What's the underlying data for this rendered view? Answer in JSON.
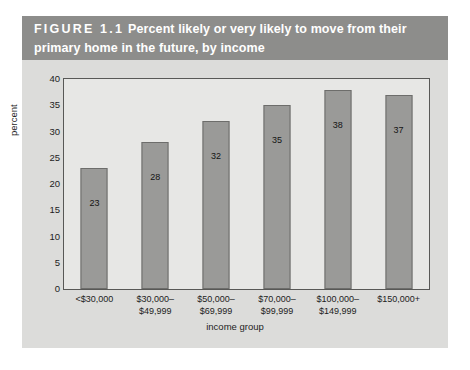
{
  "figure": {
    "number_label": "FIGURE 1.1",
    "title_line1": "Percent likely or very likely to move from their",
    "title_line2": "primary home in the future, by income",
    "header_bg": "#8d8d8b",
    "panel_bg": "#dcdcda",
    "plot_bg": "#e7e7e5",
    "bar_color": "#9a9a98",
    "bar_border_color": "#6d6d6b",
    "axis_color": "#585856"
  },
  "chart_data": {
    "type": "bar",
    "xlabel": "income group",
    "ylabel": "percent",
    "ylim": [
      0,
      40
    ],
    "yticks": [
      0,
      5,
      10,
      15,
      20,
      25,
      30,
      35,
      40
    ],
    "ytick_labels": [
      "0",
      "5",
      "10",
      "15",
      "20",
      "25",
      "30",
      "35",
      "40"
    ],
    "grid": false,
    "legend": false,
    "categories": [
      "<$30,000",
      "$30,000–$49,999",
      "$50,000–$69,999",
      "$70,000–$99,999",
      "$100,000–$149,999",
      "$150,000+"
    ],
    "category_lines": [
      [
        "<$30,000"
      ],
      [
        "$30,000–",
        "$49,999"
      ],
      [
        "$50,000–",
        "$69,999"
      ],
      [
        "$70,000–",
        "$99,999"
      ],
      [
        "$100,000–",
        "$149,999"
      ],
      [
        "$150,000+"
      ]
    ],
    "values": [
      23,
      28,
      32,
      35,
      38,
      37
    ],
    "value_labels": [
      "23",
      "28",
      "32",
      "35",
      "38",
      "37"
    ]
  }
}
